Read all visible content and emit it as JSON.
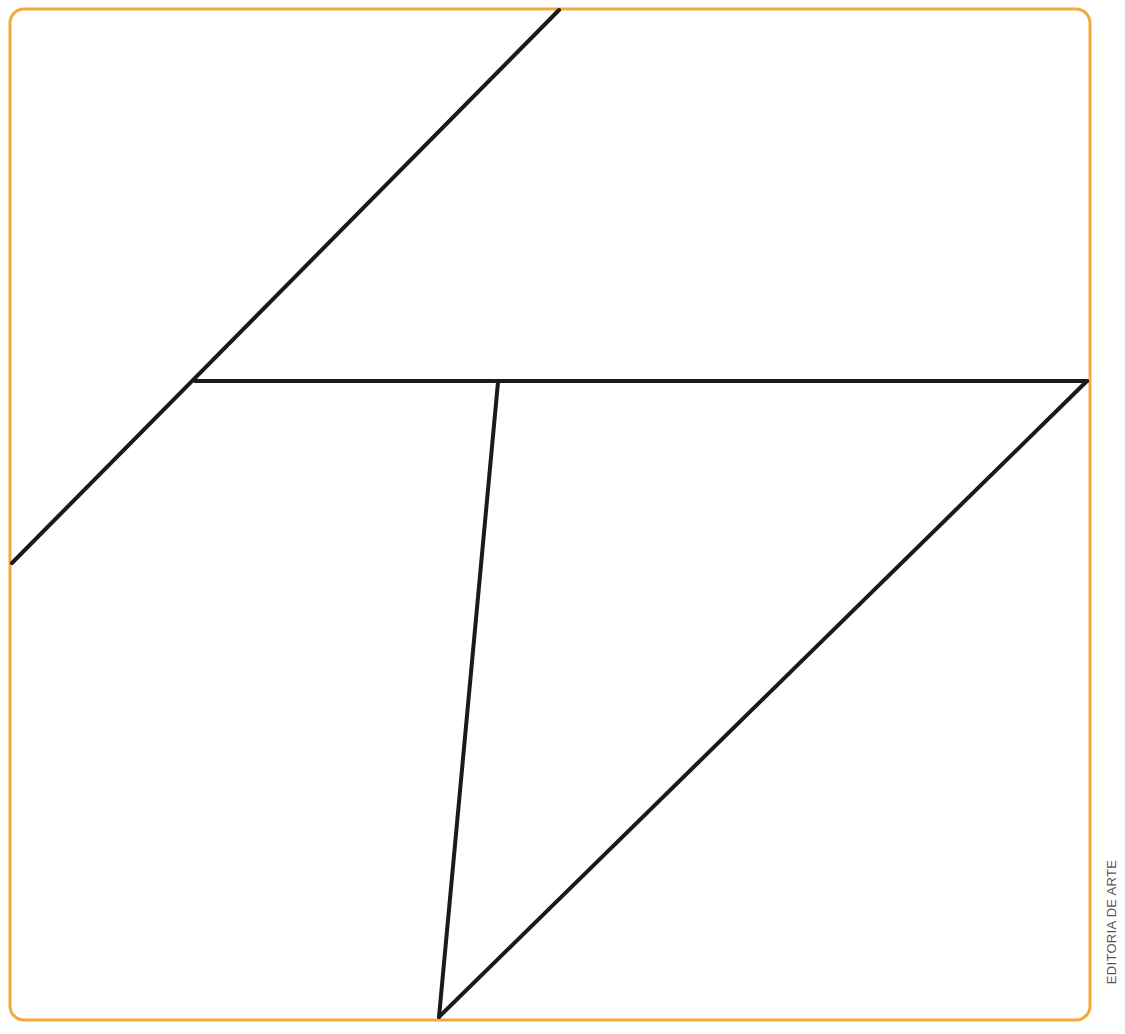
{
  "figure": {
    "colors": {
      "border": "#F5A93D",
      "lines": "#1a1a1a",
      "background": "#ffffff"
    },
    "border": {
      "x": 10,
      "y": 9,
      "width": 1080,
      "height": 1011,
      "radius": 14
    },
    "segments": [
      {
        "name": "diagonal-upper-left",
        "x1": 12,
        "y1": 563,
        "x2": 559,
        "y2": 10
      },
      {
        "name": "horizontal-middle",
        "x1": 195,
        "y1": 381,
        "x2": 1087,
        "y2": 381
      },
      {
        "name": "near-vertical-center",
        "x1": 498,
        "y1": 382,
        "x2": 439,
        "y2": 1017
      },
      {
        "name": "diagonal-lower-right",
        "x1": 1087,
        "y1": 381,
        "x2": 439,
        "y2": 1017
      }
    ]
  },
  "credit": {
    "text": "EDITORIA DE ARTE"
  }
}
